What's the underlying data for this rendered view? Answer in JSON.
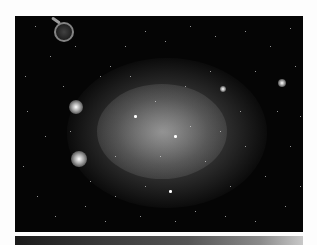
{
  "image": {
    "subject": "dwarf irregular galaxy star field",
    "colors": {
      "background": "#fdfdfd",
      "sky": "#050505",
      "stars": "#ffffff"
    }
  },
  "features": {
    "bright_blobs": [
      {
        "x": 61,
        "y": 91,
        "r": 7
      },
      {
        "x": 64,
        "y": 143,
        "r": 8
      },
      {
        "x": 267,
        "y": 67,
        "r": 4
      },
      {
        "x": 208,
        "y": 73,
        "r": 3
      }
    ],
    "ring_object": {
      "x": 47,
      "y": 14,
      "r": 8
    },
    "stars": [
      [
        20,
        10,
        1
      ],
      [
        35,
        40,
        1
      ],
      [
        48,
        70,
        1
      ],
      [
        30,
        120,
        1
      ],
      [
        22,
        180,
        1
      ],
      [
        40,
        200,
        1
      ],
      [
        70,
        190,
        1
      ],
      [
        90,
        205,
        1
      ],
      [
        110,
        30,
        1
      ],
      [
        130,
        15,
        1
      ],
      [
        150,
        25,
        1
      ],
      [
        175,
        10,
        1
      ],
      [
        200,
        20,
        1
      ],
      [
        230,
        15,
        1
      ],
      [
        255,
        30,
        1
      ],
      [
        275,
        12,
        1
      ],
      [
        280,
        50,
        1
      ],
      [
        262,
        95,
        1
      ],
      [
        275,
        130,
        1
      ],
      [
        250,
        160,
        1
      ],
      [
        270,
        190,
        1
      ],
      [
        240,
        205,
        1
      ],
      [
        210,
        200,
        1
      ],
      [
        180,
        195,
        1
      ],
      [
        155,
        175,
        2
      ],
      [
        130,
        170,
        1
      ],
      [
        120,
        100,
        2
      ],
      [
        160,
        120,
        2
      ],
      [
        175,
        110,
        1
      ],
      [
        140,
        85,
        1
      ],
      [
        100,
        140,
        1
      ],
      [
        190,
        145,
        1
      ],
      [
        85,
        60,
        1
      ],
      [
        95,
        50,
        1
      ],
      [
        115,
        60,
        1
      ],
      [
        195,
        55,
        1
      ],
      [
        225,
        95,
        1
      ],
      [
        230,
        130,
        1
      ],
      [
        215,
        170,
        1
      ],
      [
        75,
        165,
        1
      ],
      [
        10,
        60,
        1
      ],
      [
        12,
        95,
        1
      ],
      [
        8,
        150,
        1
      ],
      [
        285,
        170,
        1
      ],
      [
        285,
        100,
        1
      ],
      [
        60,
        30,
        1
      ],
      [
        240,
        55,
        1
      ],
      [
        125,
        200,
        1
      ],
      [
        160,
        205,
        1
      ],
      [
        100,
        180,
        1
      ],
      [
        55,
        115,
        1
      ],
      [
        205,
        115,
        1
      ],
      [
        145,
        140,
        1
      ],
      [
        170,
        70,
        1
      ]
    ]
  }
}
